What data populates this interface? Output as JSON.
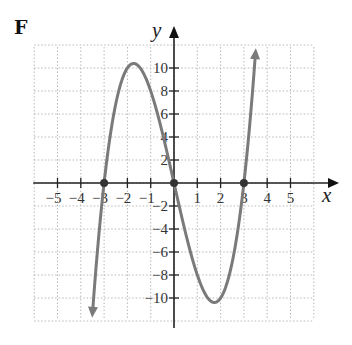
{
  "panel": {
    "label": "F"
  },
  "chart_data": {
    "type": "line",
    "title": "",
    "panel_label": "F",
    "xlabel": "x",
    "ylabel": "y",
    "xlim": [
      -6,
      6
    ],
    "ylim": [
      -12,
      12
    ],
    "grid": true,
    "x_ticks": [
      -5,
      -4,
      -3,
      -2,
      -1,
      1,
      2,
      3,
      4,
      5
    ],
    "x_tick_labels": [
      "−5",
      "−4",
      "−3",
      "−2",
      "−1",
      "1",
      "2",
      "3",
      "4",
      "5"
    ],
    "y_ticks": [
      10,
      8,
      6,
      4,
      2,
      -2,
      -4,
      -6,
      -8,
      -10
    ],
    "y_tick_labels": [
      "10",
      "8",
      "6",
      "4",
      "2",
      "−2",
      "−4",
      "−6",
      "−8",
      "−10"
    ],
    "series": [
      {
        "name": "f(x) = x^3 - 9x",
        "color": "#7a7a7a",
        "arrows_both_ends": true,
        "x": [
          -3.5,
          -3.25,
          -3.0,
          -2.5,
          -2.0,
          -1.732,
          -1.5,
          -1.0,
          -0.5,
          0.0,
          0.5,
          1.0,
          1.5,
          1.732,
          2.0,
          2.5,
          3.0,
          3.25,
          3.5
        ],
        "y": [
          -11.38,
          -5.08,
          0.0,
          6.88,
          10.0,
          10.39,
          10.13,
          8.0,
          4.38,
          0.0,
          -4.38,
          -8.0,
          -10.13,
          -10.39,
          -10.0,
          -6.88,
          0.0,
          5.08,
          11.38
        ]
      }
    ],
    "marked_points": [
      {
        "x": -3,
        "y": 0,
        "label": "x-intercept"
      },
      {
        "x": 0,
        "y": 0,
        "label": "origin"
      },
      {
        "x": 3,
        "y": 0,
        "label": "x-intercept"
      }
    ],
    "colors": {
      "curve": "#7a7a7a",
      "axis": "#222222",
      "grid": "#b8b8b8"
    }
  }
}
